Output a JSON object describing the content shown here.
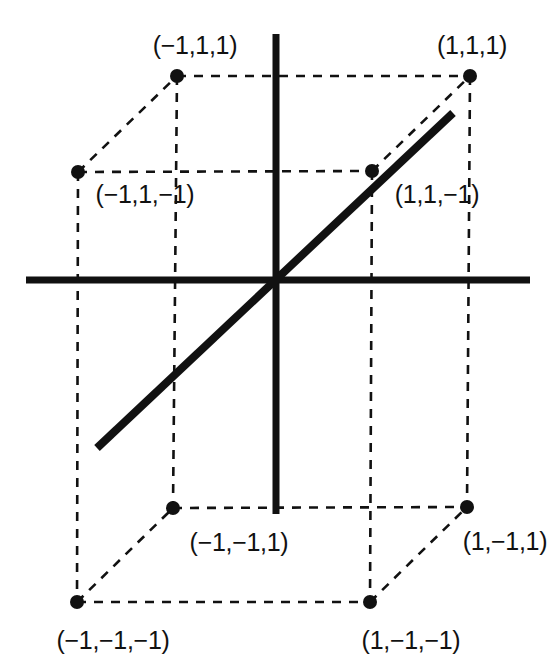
{
  "figure": {
    "width": 552,
    "height": 671,
    "background_color": "#ffffff",
    "stroke_color": "#111111"
  },
  "axes": {
    "horizontal": {
      "name": "horizontal-axis",
      "x1": 26,
      "y1": 280,
      "x2": 530,
      "y2": 280,
      "width": 7
    },
    "vertical": {
      "name": "vertical-axis",
      "x1": 276,
      "y1": 34,
      "x2": 276,
      "y2": 514,
      "width": 7
    },
    "origin": {
      "x": 276,
      "y": 280
    }
  },
  "diagonal": {
    "name": "space-diagonal",
    "x1": 97,
    "y1": 448,
    "x2": 453,
    "y2": 113,
    "width": 8
  },
  "vertices": [
    {
      "id": "v-m1-p1-p1",
      "label": "(−1,1,1)",
      "cx": 177,
      "cy": 76,
      "lx": 195,
      "ly": 45,
      "r": 7
    },
    {
      "id": "v-p1-p1-p1",
      "label": "(1,1,1)",
      "cx": 470,
      "cy": 76,
      "lx": 472,
      "ly": 45,
      "r": 7
    },
    {
      "id": "v-m1-p1-m1",
      "label": "(−1,1,−1)",
      "cx": 78,
      "cy": 172,
      "lx": 145,
      "ly": 194,
      "r": 7
    },
    {
      "id": "v-p1-p1-m1",
      "label": "(1,1,−1)",
      "cx": 372,
      "cy": 171,
      "lx": 437,
      "ly": 194,
      "r": 7
    },
    {
      "id": "v-m1-m1-p1",
      "label": "(−1,−1,1)",
      "cx": 173,
      "cy": 508,
      "lx": 239,
      "ly": 542,
      "r": 7
    },
    {
      "id": "v-p1-m1-p1",
      "label": "(1,−1,1)",
      "cx": 467,
      "cy": 507,
      "lx": 505,
      "ly": 541,
      "r": 7
    },
    {
      "id": "v-m1-m1-m1",
      "label": "(−1,−1,−1)",
      "cx": 77,
      "cy": 602,
      "lx": 113,
      "ly": 640,
      "r": 7
    },
    {
      "id": "v-p1-m1-m1",
      "label": "(1,−1,−1)",
      "cx": 370,
      "cy": 602,
      "lx": 411,
      "ly": 640,
      "r": 7
    }
  ],
  "cube_edges": [
    {
      "name": "edge-front-top",
      "x1": 177,
      "y1": 76,
      "x2": 470,
      "y2": 76
    },
    {
      "name": "edge-front-left",
      "x1": 177,
      "y1": 76,
      "x2": 173,
      "y2": 508
    },
    {
      "name": "edge-front-right",
      "x1": 470,
      "y1": 76,
      "x2": 467,
      "y2": 507
    },
    {
      "name": "edge-front-bottom",
      "x1": 173,
      "y1": 508,
      "x2": 467,
      "y2": 507
    },
    {
      "name": "edge-back-top",
      "x1": 78,
      "y1": 172,
      "x2": 372,
      "y2": 171
    },
    {
      "name": "edge-back-left",
      "x1": 78,
      "y1": 172,
      "x2": 77,
      "y2": 602
    },
    {
      "name": "edge-back-right",
      "x1": 372,
      "y1": 171,
      "x2": 370,
      "y2": 602
    },
    {
      "name": "edge-back-bottom",
      "x1": 77,
      "y1": 602,
      "x2": 370,
      "y2": 602
    },
    {
      "name": "edge-depth-top-left",
      "x1": 78,
      "y1": 172,
      "x2": 177,
      "y2": 76
    },
    {
      "name": "edge-depth-top-right",
      "x1": 372,
      "y1": 171,
      "x2": 470,
      "y2": 76
    },
    {
      "name": "edge-depth-bottom-left",
      "x1": 77,
      "y1": 602,
      "x2": 173,
      "y2": 508
    },
    {
      "name": "edge-depth-bottom-right",
      "x1": 370,
      "y1": 602,
      "x2": 467,
      "y2": 507
    }
  ],
  "chart_data": {
    "type": "scatter",
    "title": "",
    "xlabel": "",
    "ylabel": "",
    "points": [
      {
        "label": "(−1,1,1)",
        "coords": [
          -1,
          1,
          1
        ]
      },
      {
        "label": "(1,1,1)",
        "coords": [
          1,
          1,
          1
        ]
      },
      {
        "label": "(−1,1,−1)",
        "coords": [
          -1,
          1,
          -1
        ]
      },
      {
        "label": "(1,1,−1)",
        "coords": [
          1,
          1,
          -1
        ]
      },
      {
        "label": "(−1,−1,1)",
        "coords": [
          -1,
          -1,
          1
        ]
      },
      {
        "label": "(1,−1,1)",
        "coords": [
          1,
          -1,
          1
        ]
      },
      {
        "label": "(−1,−1,−1)",
        "coords": [
          -1,
          -1,
          -1
        ]
      },
      {
        "label": "(1,−1,−1)",
        "coords": [
          1,
          -1,
          -1
        ]
      }
    ],
    "annotations": [
      "space diagonal from (−1,−1,−1) toward (1,1,1)"
    ],
    "grid": false,
    "legend": "none"
  }
}
